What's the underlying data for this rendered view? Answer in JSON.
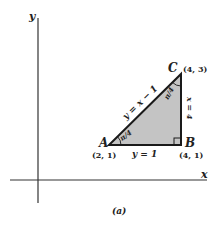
{
  "figure": {
    "caption": "(a)",
    "axes": {
      "x_label": "x",
      "y_label": "y"
    },
    "colors": {
      "fill": "#c4c4c4",
      "line": "#1a1a1a",
      "axis": "#333333"
    },
    "points": [
      {
        "name": "A",
        "coord": "(2, 1)"
      },
      {
        "name": "B",
        "coord": "(4, 1)"
      },
      {
        "name": "C",
        "coord": "(4, 3)"
      }
    ],
    "edges": {
      "AC": "y = x − 1",
      "AB": "y = 1",
      "BC": "x = 4"
    },
    "angles": {
      "A": "π/4",
      "C": "π/4"
    }
  }
}
